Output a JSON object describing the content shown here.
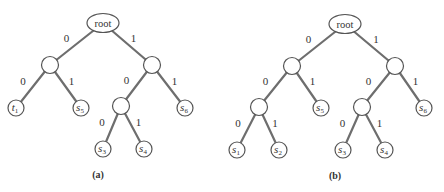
{
  "diagrams": [
    {
      "caption": "(a)",
      "root_label": "root",
      "nodes": [
        {
          "id": "root",
          "type": "root",
          "label": "root"
        },
        {
          "id": "n0",
          "type": "internal"
        },
        {
          "id": "n1",
          "type": "internal"
        },
        {
          "id": "n10",
          "type": "internal"
        },
        {
          "id": "t1",
          "type": "leaf",
          "symbol": "t",
          "index": "1"
        },
        {
          "id": "s5",
          "type": "leaf",
          "symbol": "s",
          "index": "5"
        },
        {
          "id": "s6",
          "type": "leaf",
          "symbol": "s",
          "index": "6"
        },
        {
          "id": "s3",
          "type": "leaf",
          "symbol": "s",
          "index": "3"
        },
        {
          "id": "s4",
          "type": "leaf",
          "symbol": "s",
          "index": "4"
        }
      ],
      "edges": [
        {
          "from": "root",
          "to": "n0",
          "bit": "0"
        },
        {
          "from": "root",
          "to": "n1",
          "bit": "1"
        },
        {
          "from": "n0",
          "to": "t1",
          "bit": "0"
        },
        {
          "from": "n0",
          "to": "s5",
          "bit": "1"
        },
        {
          "from": "n1",
          "to": "n10",
          "bit": "0"
        },
        {
          "from": "n1",
          "to": "s6",
          "bit": "1"
        },
        {
          "from": "n10",
          "to": "s3",
          "bit": "0"
        },
        {
          "from": "n10",
          "to": "s4",
          "bit": "1"
        }
      ]
    },
    {
      "caption": "(b)",
      "root_label": "root",
      "nodes": [
        {
          "id": "root",
          "type": "root",
          "label": "root"
        },
        {
          "id": "n0",
          "type": "internal"
        },
        {
          "id": "n1",
          "type": "internal"
        },
        {
          "id": "n00",
          "type": "internal"
        },
        {
          "id": "n10",
          "type": "internal"
        },
        {
          "id": "s5",
          "type": "leaf",
          "symbol": "s",
          "index": "5"
        },
        {
          "id": "s6",
          "type": "leaf",
          "symbol": "s",
          "index": "6"
        },
        {
          "id": "s1",
          "type": "leaf",
          "symbol": "s",
          "index": "1"
        },
        {
          "id": "s2",
          "type": "leaf",
          "symbol": "s",
          "index": "2"
        },
        {
          "id": "s3",
          "type": "leaf",
          "symbol": "s",
          "index": "3"
        },
        {
          "id": "s4",
          "type": "leaf",
          "symbol": "s",
          "index": "4"
        }
      ],
      "edges": [
        {
          "from": "root",
          "to": "n0",
          "bit": "0"
        },
        {
          "from": "root",
          "to": "n1",
          "bit": "1"
        },
        {
          "from": "n0",
          "to": "n00",
          "bit": "0"
        },
        {
          "from": "n0",
          "to": "s5",
          "bit": "1"
        },
        {
          "from": "n1",
          "to": "n10",
          "bit": "0"
        },
        {
          "from": "n1",
          "to": "s6",
          "bit": "1"
        },
        {
          "from": "n00",
          "to": "s1",
          "bit": "0"
        },
        {
          "from": "n00",
          "to": "s2",
          "bit": "1"
        },
        {
          "from": "n10",
          "to": "s3",
          "bit": "0"
        },
        {
          "from": "n10",
          "to": "s4",
          "bit": "1"
        }
      ]
    }
  ]
}
